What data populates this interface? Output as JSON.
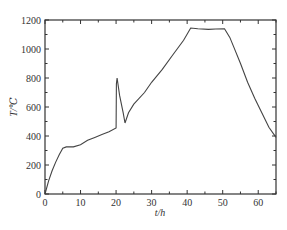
{
  "chart_data": {
    "type": "line",
    "title": "",
    "xlabel": "t/h",
    "ylabel": "T/℃",
    "xlim": [
      0,
      65
    ],
    "ylim": [
      0,
      1200
    ],
    "xticks": [
      0,
      10,
      20,
      30,
      40,
      50,
      60
    ],
    "yticks": [
      0,
      200,
      400,
      600,
      800,
      1000,
      1200
    ],
    "grid": false,
    "legend": null,
    "series": [
      {
        "name": "temperature",
        "x": [
          0,
          1,
          2,
          3,
          4,
          5,
          6,
          8,
          10,
          12,
          14,
          16,
          18,
          20,
          20.1,
          20.3,
          21,
          22,
          22.5,
          23.5,
          25,
          28,
          30,
          33,
          36,
          39,
          41,
          43,
          46,
          48,
          50.5,
          52,
          53,
          55,
          57,
          59,
          61,
          63,
          65
        ],
        "y": [
          0,
          90,
          160,
          220,
          270,
          315,
          325,
          325,
          340,
          370,
          390,
          410,
          430,
          455,
          760,
          800,
          680,
          560,
          490,
          560,
          620,
          700,
          770,
          860,
          960,
          1060,
          1145,
          1140,
          1135,
          1138,
          1140,
          1080,
          1020,
          900,
          770,
          660,
          560,
          460,
          390
        ]
      }
    ]
  },
  "axes": {
    "x_label_italic": "t",
    "x_label_unit": "/h",
    "y_label_italic": "T",
    "y_label_unit": "/℃"
  }
}
